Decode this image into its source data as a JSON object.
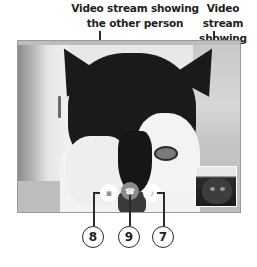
{
  "captions": {
    "other_person": {
      "line1": "Video stream showing",
      "line2": "the other person"
    },
    "you": {
      "line1": "Video stream",
      "line2": "showing you"
    }
  },
  "video_call": {
    "remote_stream": {
      "subject": "cat"
    },
    "self_view": {
      "subject": "cat"
    },
    "controls": [
      {
        "id": "camera",
        "icon": "camera-icon",
        "glyph": "◙"
      },
      {
        "id": "end",
        "icon": "end-call-icon",
        "glyph": "☎"
      },
      {
        "id": "mic",
        "icon": "microphone-icon",
        "glyph": "♪"
      }
    ]
  },
  "callouts": [
    {
      "number": "8",
      "target": "camera"
    },
    {
      "number": "9",
      "target": "end"
    },
    {
      "number": "7",
      "target": "mic"
    }
  ]
}
